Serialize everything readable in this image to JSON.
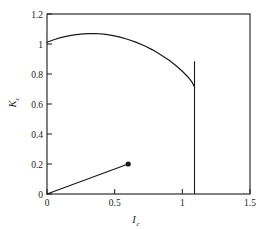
{
  "chart_data": {
    "type": "line",
    "title": "",
    "xlabel": "I_c",
    "xlabel_base": "I",
    "xlabel_sub": "c",
    "ylabel": "K_c",
    "ylabel_base": "K",
    "ylabel_sub": "c",
    "xlim": [
      0,
      1.5
    ],
    "ylim": [
      0,
      1.2
    ],
    "grid": false,
    "legend": null,
    "xticks": [
      0,
      0.5,
      1,
      1.5
    ],
    "xtick_labels": [
      "0",
      "0.5",
      "1",
      "1.5"
    ],
    "yticks": [
      0,
      0.2,
      0.4,
      0.6,
      0.8,
      1,
      1.2
    ],
    "ytick_labels": [
      "0",
      "0.2",
      "0.4",
      "0.6",
      "0.8",
      "1",
      "1.2"
    ],
    "line_color": "#1a1a1a",
    "frame_color": "#1a1a1a",
    "background": "#ffffff",
    "series": [
      {
        "name": "upper-branch",
        "type": "curve",
        "points": [
          [
            0.0,
            1.012
          ],
          [
            0.05,
            1.028
          ],
          [
            0.1,
            1.042
          ],
          [
            0.15,
            1.053
          ],
          [
            0.2,
            1.061
          ],
          [
            0.25,
            1.066
          ],
          [
            0.3,
            1.069
          ],
          [
            0.36,
            1.07
          ],
          [
            0.42,
            1.066
          ],
          [
            0.48,
            1.058
          ],
          [
            0.54,
            1.046
          ],
          [
            0.6,
            1.03
          ],
          [
            0.66,
            1.011
          ],
          [
            0.72,
            0.988
          ],
          [
            0.78,
            0.961
          ],
          [
            0.84,
            0.929
          ],
          [
            0.9,
            0.893
          ],
          [
            0.95,
            0.858
          ],
          [
            1.0,
            0.818
          ],
          [
            1.04,
            0.782
          ],
          [
            1.07,
            0.748
          ],
          [
            1.09,
            0.714
          ]
        ]
      },
      {
        "name": "lower-branch",
        "type": "segment",
        "points": [
          [
            0.0,
            0.0
          ],
          [
            0.6,
            0.2
          ]
        ],
        "end_marker": "filled-circle"
      },
      {
        "name": "vertical-transition-line",
        "type": "vline",
        "x": 1.09,
        "y_from": 0.0,
        "y_to": 0.885
      }
    ],
    "markers": [
      {
        "name": "branch-endpoint",
        "x": 0.6,
        "y": 0.2,
        "style": "filled-circle"
      }
    ]
  }
}
